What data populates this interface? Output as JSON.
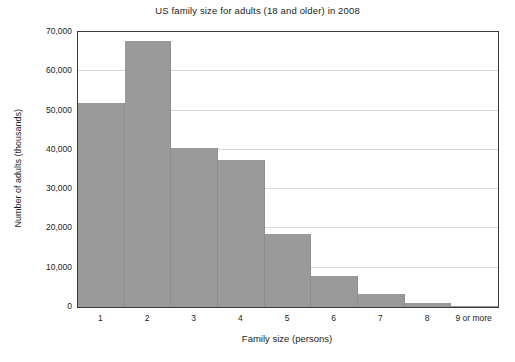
{
  "chart_data": {
    "type": "bar",
    "title": "US family size for adults (18 and older) in 2008",
    "xlabel": "Family size (persons)",
    "ylabel": "Number of adults (thousands)",
    "categories": [
      "1",
      "2",
      "3",
      "4",
      "5",
      "6",
      "7",
      "8",
      "9 or more"
    ],
    "values": [
      51900,
      67700,
      40400,
      37300,
      18700,
      7900,
      3300,
      1000,
      200
    ],
    "ylim": [
      0,
      70000
    ],
    "yticks": [
      0,
      10000,
      20000,
      30000,
      40000,
      50000,
      60000,
      70000
    ],
    "ytick_labels": [
      "0",
      "10,000",
      "20,000",
      "30,000",
      "40,000",
      "50,000",
      "60,000",
      "70,000"
    ],
    "grid": true,
    "legend": false,
    "bar_color": "#9a9a9a",
    "axis_color": "#3a3a3a",
    "grid_color": "#d9d9d9",
    "background": "#ffffff"
  }
}
